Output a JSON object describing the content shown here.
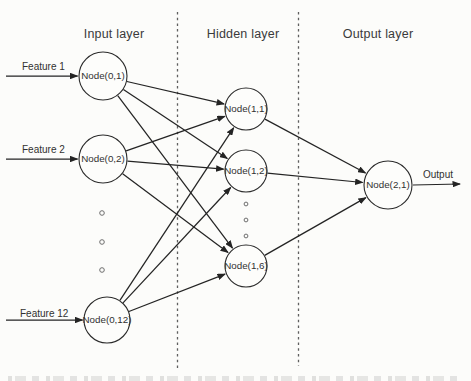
{
  "figure": {
    "background": "#fcfcfa",
    "line_color": "#242424",
    "dash_color": "#5f5f5f",
    "text_color": "#333333"
  },
  "diagram": {
    "layers": [
      {
        "id": "input",
        "label": "Input layer"
      },
      {
        "id": "hidden",
        "label": "Hidden layer"
      },
      {
        "id": "output",
        "label": "Output layer"
      }
    ],
    "nodes": [
      {
        "id": "input-1",
        "layer": "input",
        "label": "Node(0,1)"
      },
      {
        "id": "input-2",
        "layer": "input",
        "label": "Node(0,2)"
      },
      {
        "id": "input-12",
        "layer": "input",
        "label": "Node(0,12)"
      },
      {
        "id": "hidden-1",
        "layer": "hidden",
        "label": "Node(1,1)"
      },
      {
        "id": "hidden-2",
        "layer": "hidden",
        "label": "Node(1,2)"
      },
      {
        "id": "hidden-6",
        "layer": "hidden",
        "label": "Node(1,6)"
      },
      {
        "id": "output-1",
        "layer": "output",
        "label": "Node(2,1)"
      }
    ],
    "input_arrows": [
      {
        "label": "Feature 1",
        "target": "input-1"
      },
      {
        "label": "Feature 2",
        "target": "input-2"
      },
      {
        "label": "Feature 12",
        "target": "input-12"
      }
    ],
    "output_arrow": {
      "label": "Output",
      "source": "output-1"
    },
    "edges": [
      [
        "input-1",
        "hidden-1"
      ],
      [
        "input-1",
        "hidden-2"
      ],
      [
        "input-1",
        "hidden-6"
      ],
      [
        "input-2",
        "hidden-1"
      ],
      [
        "input-2",
        "hidden-2"
      ],
      [
        "input-2",
        "hidden-6"
      ],
      [
        "input-12",
        "hidden-1"
      ],
      [
        "input-12",
        "hidden-2"
      ],
      [
        "input-12",
        "hidden-6"
      ],
      [
        "hidden-1",
        "output-1"
      ],
      [
        "hidden-2",
        "output-1"
      ],
      [
        "hidden-6",
        "output-1"
      ]
    ],
    "ellipsis_columns": [
      "input",
      "hidden"
    ]
  }
}
